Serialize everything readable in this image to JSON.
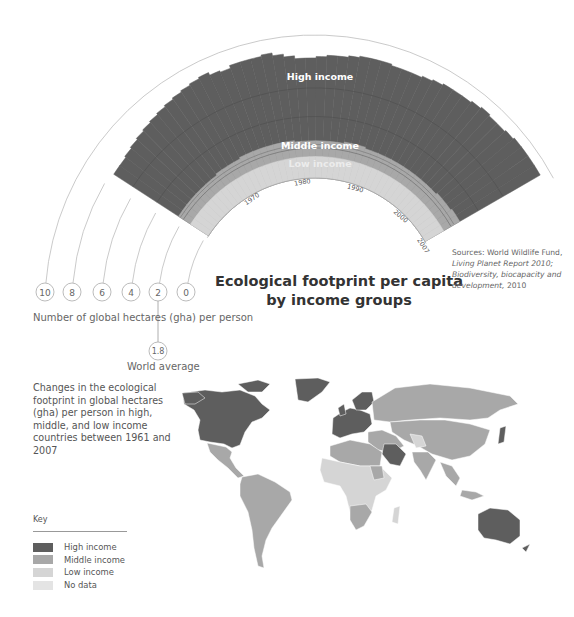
{
  "title": {
    "line1": "Ecological footprint per capita",
    "line2": "by income groups"
  },
  "sources": {
    "line1": "Sources: World Wildlife Fund,",
    "line2": "Living Planet Report 2010;",
    "line3": "Biodiversity, biocapacity and",
    "line4_italic": "development,",
    "line4_rest": " 2010"
  },
  "axis": {
    "caption": "Number of global hectares (gha) per person",
    "ticks": [
      "10",
      "8",
      "6",
      "4",
      "2",
      "0"
    ],
    "world_average_value": "1.8",
    "world_average_label": "World average"
  },
  "description": "Changes in the ecological footprint in global hectares (gha) per person in high, middle, and low income countries between 1961 and 2007",
  "key": {
    "title": "Key",
    "items": [
      {
        "label": "High income",
        "color": "#5e5e5e"
      },
      {
        "label": "Middle income",
        "color": "#a8a8a8"
      },
      {
        "label": "Low income",
        "color": "#d5d5d5"
      },
      {
        "label": "No data",
        "color": "#e4e4e4"
      }
    ]
  },
  "band_labels": {
    "high": "High income",
    "middle": "Middle income",
    "low": "Low income"
  },
  "year_labels": [
    "1970",
    "1980",
    "1990",
    "2000",
    "2007"
  ],
  "colors": {
    "high": "#5e5e5e",
    "middle": "#a8a8a8",
    "low": "#d5d5d5",
    "nodata": "#e4e4e4",
    "ring": "#bdbdbd"
  },
  "chart_data": {
    "type": "area",
    "subtype": "radial stepped area (fan)",
    "title": "Ecological footprint per capita by income groups",
    "xlabel": "Year",
    "ylabel": "Number of global hectares (gha) per person",
    "x_range": [
      1961,
      2007
    ],
    "ylim": [
      0,
      10
    ],
    "radial_ticks": [
      0,
      2,
      4,
      6,
      8,
      10
    ],
    "reference_line": {
      "label": "World average",
      "value": 1.8
    },
    "x": [
      1961,
      1962,
      1963,
      1964,
      1965,
      1966,
      1967,
      1968,
      1969,
      1970,
      1971,
      1972,
      1973,
      1974,
      1975,
      1976,
      1977,
      1978,
      1979,
      1980,
      1981,
      1982,
      1983,
      1984,
      1985,
      1986,
      1987,
      1988,
      1989,
      1990,
      1991,
      1992,
      1993,
      1994,
      1995,
      1996,
      1997,
      1998,
      1999,
      2000,
      2001,
      2002,
      2003,
      2004,
      2005,
      2006,
      2007
    ],
    "series": [
      {
        "name": "High income",
        "values": [
          7.9,
          7.9,
          8.0,
          8.1,
          8.2,
          8.3,
          8.4,
          8.5,
          8.6,
          8.7,
          8.8,
          8.9,
          9.0,
          8.8,
          8.7,
          8.9,
          8.9,
          8.9,
          9.0,
          8.8,
          8.6,
          8.4,
          8.4,
          8.5,
          8.6,
          8.6,
          8.7,
          8.8,
          8.8,
          8.8,
          8.7,
          8.7,
          8.7,
          8.8,
          8.9,
          9.0,
          9.0,
          9.0,
          9.1,
          9.2,
          9.1,
          9.1,
          9.2,
          9.3,
          9.3,
          9.3,
          9.3
        ]
      },
      {
        "name": "Middle income",
        "values": [
          2.5,
          2.5,
          2.5,
          2.5,
          2.5,
          2.5,
          2.5,
          2.5,
          2.6,
          2.6,
          2.6,
          2.6,
          2.7,
          2.7,
          2.7,
          2.7,
          2.7,
          2.7,
          2.7,
          2.7,
          2.6,
          2.6,
          2.6,
          2.6,
          2.6,
          2.6,
          2.6,
          2.7,
          2.7,
          2.7,
          2.6,
          2.6,
          2.6,
          2.6,
          2.6,
          2.6,
          2.6,
          2.6,
          2.6,
          2.6,
          2.6,
          2.6,
          2.7,
          2.7,
          2.7,
          2.8,
          2.8
        ]
      },
      {
        "name": "Low income",
        "values": [
          1.5,
          1.5,
          1.5,
          1.5,
          1.5,
          1.5,
          1.5,
          1.5,
          1.5,
          1.5,
          1.5,
          1.5,
          1.5,
          1.5,
          1.5,
          1.5,
          1.5,
          1.5,
          1.5,
          1.5,
          1.5,
          1.5,
          1.5,
          1.5,
          1.5,
          1.5,
          1.5,
          1.5,
          1.5,
          1.5,
          1.5,
          1.5,
          1.5,
          1.5,
          1.5,
          1.5,
          1.5,
          1.5,
          1.5,
          1.5,
          1.5,
          1.5,
          1.5,
          1.5,
          1.5,
          1.5,
          1.5
        ]
      }
    ],
    "legend": [
      "High income",
      "Middle income",
      "Low income",
      "No data"
    ],
    "legend_position": "bottom-left"
  }
}
